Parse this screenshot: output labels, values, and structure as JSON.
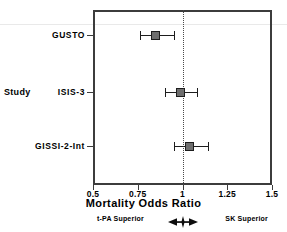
{
  "chart_data": {
    "type": "scatter",
    "subtype": "forest-plot",
    "title": "",
    "xlabel": "Mortality Odds Ratio",
    "ylabel": "Study",
    "xlim": [
      0.5,
      1.5
    ],
    "xticks": [
      0.5,
      0.75,
      1,
      1.25,
      1.5
    ],
    "xticklabels": [
      "0.5",
      "0.75",
      "1",
      "1.25",
      "1.5"
    ],
    "grid": false,
    "legend": null,
    "reference_line": 1,
    "reference_line_style": "dotted",
    "categories": [
      "GUSTO",
      "ISIS-3",
      "GISSI-2-Int"
    ],
    "series": [
      {
        "name": "Mortality Odds Ratio",
        "values": [
          0.85,
          0.99,
          1.04
        ],
        "ci_low": [
          0.76,
          0.9,
          0.95
        ],
        "ci_high": [
          0.95,
          1.08,
          1.14
        ]
      }
    ],
    "points": [
      {
        "label": "GUSTO",
        "or": 0.85,
        "ci_low": 0.76,
        "ci_high": 0.95
      },
      {
        "label": "ISIS-3",
        "or": 0.99,
        "ci_low": 0.9,
        "ci_high": 1.08
      },
      {
        "label": "GISSI-2-Int",
        "or": 1.04,
        "ci_low": 0.95,
        "ci_high": 1.14
      }
    ],
    "annotations": {
      "left_label": "t-PA Superior",
      "right_label": "SK Superior",
      "arrow": "left-right-arrow-icon"
    },
    "colors": {
      "marker_fill": "#6e6e6e",
      "marker_edge": "#1d1d1d",
      "ci_line": "#1d1d1d",
      "frame": "#3c3c3c",
      "reference_line": "#4a4a4a",
      "background": "#ffffff",
      "text": "#000000"
    }
  },
  "axis": {
    "y_title": "Study",
    "x_title": "Mortality Odds Ratio"
  },
  "ticks": {
    "x": [
      {
        "value": "0.5"
      },
      {
        "value": "0.75"
      },
      {
        "value": "1"
      },
      {
        "value": "1.25"
      },
      {
        "value": "1.5"
      }
    ]
  },
  "rows": [
    {
      "label": "GUSTO"
    },
    {
      "label": "ISIS-3"
    },
    {
      "label": "GISSI-2-Int"
    }
  ],
  "footer": {
    "left": "t-PA Superior",
    "right": "SK Superior"
  }
}
